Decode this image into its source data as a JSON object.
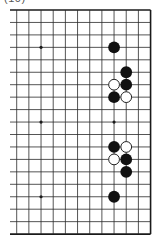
{
  "figure": {
    "label": "(10)"
  },
  "board": {
    "line_color": "#2a2a2a",
    "border_color": "#1a1a1a",
    "background": "#ffffff",
    "origin_x": 16.7,
    "origin_y": 10,
    "spacing_x": 12.17,
    "spacing_y": 12.45,
    "cols": 12,
    "rows": 19,
    "left_open_extent_x": 10,
    "open_left_edge": true,
    "right_border": true,
    "top_border": true,
    "bottom_border": true,
    "star_points": [
      {
        "col": 2,
        "row": 3
      },
      {
        "col": 2,
        "row": 9
      },
      {
        "col": 2,
        "row": 15
      },
      {
        "col": 8,
        "row": 9
      }
    ],
    "stones": [
      {
        "color": "black",
        "col": 8,
        "row": 3
      },
      {
        "color": "black",
        "col": 9,
        "row": 5
      },
      {
        "color": "white",
        "col": 8,
        "row": 6
      },
      {
        "color": "black",
        "col": 9,
        "row": 6
      },
      {
        "color": "black",
        "col": 8,
        "row": 7
      },
      {
        "color": "white",
        "col": 9,
        "row": 7
      },
      {
        "color": "black",
        "col": 8,
        "row": 11
      },
      {
        "color": "white",
        "col": 9,
        "row": 11
      },
      {
        "color": "white",
        "col": 8,
        "row": 12
      },
      {
        "color": "black",
        "col": 9,
        "row": 12
      },
      {
        "color": "black",
        "col": 9,
        "row": 13
      },
      {
        "color": "black",
        "col": 8,
        "row": 15
      }
    ],
    "stone_colors": {
      "black": "#111111",
      "white": "#ffffff",
      "white_outline": "#222222"
    }
  }
}
